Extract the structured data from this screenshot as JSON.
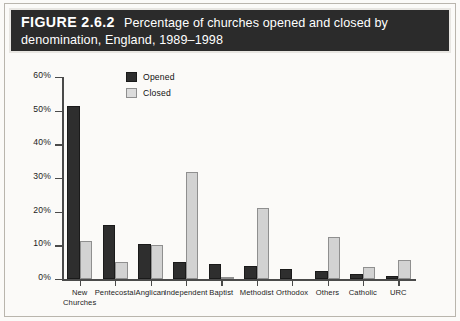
{
  "figure": {
    "number_label": "FIGURE 2.6.2",
    "caption_line1": "Percentage of churches opened and closed by",
    "caption_line2": "denomination, England, 1989–1998"
  },
  "colors": {
    "banner_background": "#2b2b2b",
    "banner_text": "#ffffff",
    "page_background": "#fbfaf8",
    "opened_series": "#2e2e2e",
    "closed_series": "#d2d2d2",
    "axis": "#4a4a4a"
  },
  "chart_data": {
    "type": "bar",
    "title": "Percentage of churches opened and closed by denomination, England, 1989–1998",
    "xlabel": "",
    "ylabel": "",
    "ylim": [
      0,
      60
    ],
    "yticks": [
      0,
      10,
      20,
      30,
      40,
      50,
      60
    ],
    "ytick_labels": [
      "0%",
      "10%",
      "20%",
      "30%",
      "40%",
      "50%",
      "60%"
    ],
    "grid": false,
    "legend_position": "upper-left-inside",
    "categories": [
      "New Churches",
      "Pentecostal",
      "Anglican",
      "Independent",
      "Baptist",
      "Methodist",
      "Orthodox",
      "Others",
      "Catholic",
      "URC"
    ],
    "category_lines": [
      [
        "New",
        "Churches"
      ],
      [
        "Pentecostal"
      ],
      [
        "Anglican"
      ],
      [
        "Independent"
      ],
      [
        "Baptist"
      ],
      [
        "Methodist"
      ],
      [
        "Orthodox"
      ],
      [
        "Others"
      ],
      [
        "Catholic"
      ],
      [
        "URC"
      ]
    ],
    "series": [
      {
        "name": "Opened",
        "color": "#2e2e2e",
        "values": [
          51.5,
          16.0,
          10.5,
          5.0,
          4.5,
          4.0,
          3.0,
          2.5,
          1.5,
          1.0
        ]
      },
      {
        "name": "Closed",
        "color": "#d2d2d2",
        "values": [
          11.3,
          5.0,
          10.0,
          31.8,
          0.6,
          21.0,
          0.0,
          12.5,
          3.5,
          5.5
        ]
      }
    ]
  }
}
